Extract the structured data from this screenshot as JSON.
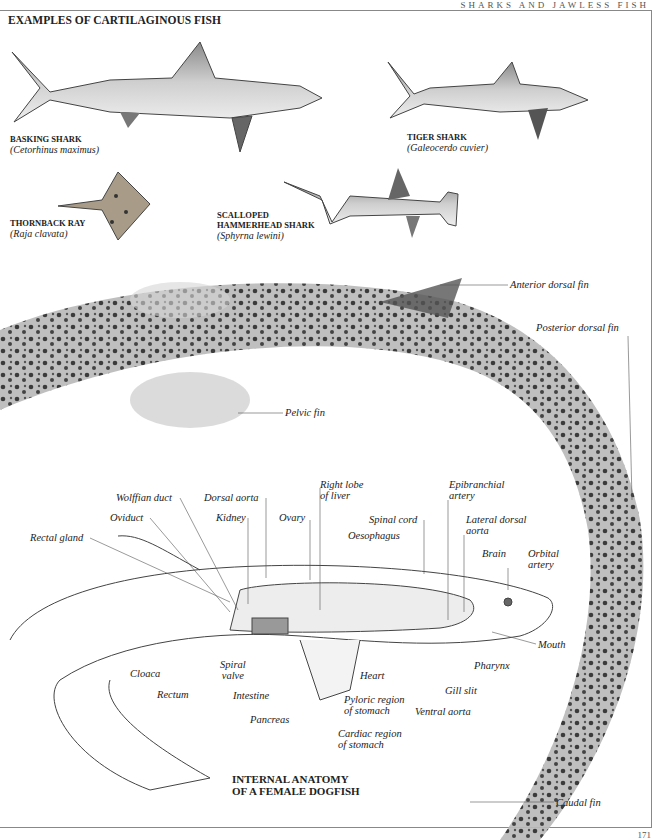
{
  "header": {
    "running_title": "SHARKS AND JAWLESS FISH",
    "page_number": "171"
  },
  "section_title": "EXAMPLES OF CARTILAGINOUS FISH",
  "species": [
    {
      "common": "BASKING SHARK",
      "scientific": "(Cetorhinus maximus)"
    },
    {
      "common": "TIGER SHARK",
      "scientific": "(Galeocerdo cuvier)"
    },
    {
      "common": "THORNBACK RAY",
      "scientific": "(Raja clavata)"
    },
    {
      "common": "SCALLOPED HAMMERHEAD SHARK",
      "common_line1": "SCALLOPED",
      "common_line2": "HAMMERHEAD SHARK",
      "scientific": "(Sphyrna lewini)"
    }
  ],
  "external_labels": {
    "anterior_dorsal_fin": "Anterior dorsal fin",
    "posterior_dorsal_fin": "Posterior dorsal fin",
    "pelvic_fin": "Pelvic fin",
    "caudal_fin": "Caudal fin"
  },
  "anatomy": {
    "title_line1": "INTERNAL ANATOMY",
    "title_line2": "OF A FEMALE DOGFISH",
    "labels": {
      "wolffian_duct": "Wolffian duct",
      "dorsal_aorta": "Dorsal aorta",
      "right_lobe_1": "Right lobe",
      "right_lobe_2": "of liver",
      "epibranchial_1": "Epibranchial",
      "epibranchial_2": "artery",
      "oviduct": "Oviduct",
      "kidney": "Kidney",
      "ovary": "Ovary",
      "spinal_cord": "Spinal cord",
      "lateral_dorsal_1": "Lateral dorsal",
      "lateral_dorsal_2": "aorta",
      "oesophagus": "Oesophagus",
      "rectal_gland": "Rectal gland",
      "brain": "Brain",
      "orbital_1": "Orbital",
      "orbital_2": "artery",
      "mouth": "Mouth",
      "cloaca": "Cloaca",
      "spiral_1": "Spiral",
      "spiral_2": "valve",
      "pharynx": "Pharynx",
      "heart": "Heart",
      "gill_slit": "Gill slit",
      "rectum": "Rectum",
      "intestine": "Intestine",
      "pyloric_1": "Pyloric region",
      "pyloric_2": "of stomach",
      "ventral_aorta": "Ventral aorta",
      "pancreas": "Pancreas",
      "cardiac_1": "Cardiac region",
      "cardiac_2": "of stomach"
    }
  }
}
